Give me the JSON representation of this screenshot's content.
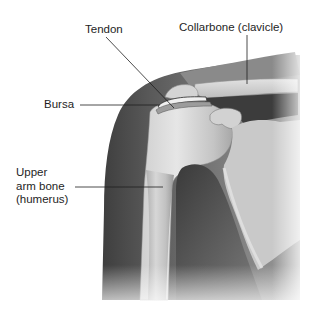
{
  "diagram": {
    "type": "anatomical-illustration",
    "labels": {
      "tendon": "Tendon",
      "collarbone": "Collarbone (clavicle)",
      "bursa": "Bursa",
      "humerus": "Upper\narm bone\n(humerus)"
    },
    "structures": [
      {
        "id": "tendon",
        "label": "Tendon"
      },
      {
        "id": "collarbone",
        "label": "Collarbone (clavicle)"
      },
      {
        "id": "bursa",
        "label": "Bursa"
      },
      {
        "id": "humerus",
        "label": "Upper arm bone (humerus)"
      }
    ],
    "colors": {
      "background": "#ffffff",
      "muscle_dark": "#4a4a4a",
      "muscle_mid": "#6e6e6e",
      "bone_light": "#dcdcdc",
      "bone_mid": "#bdbdbd",
      "leader_line": "#1e1e1e",
      "text": "#1e1e1e"
    }
  }
}
